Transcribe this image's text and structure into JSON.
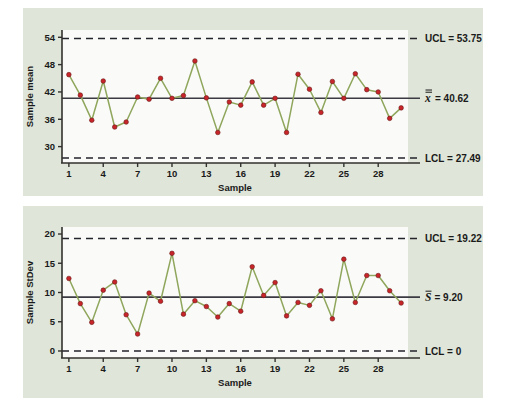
{
  "figure": {
    "background_color": "#ffffff",
    "panel_color": "#dfe5d8",
    "plot_background_color": "#fafbf9",
    "series_line_color": "#8fa65c",
    "series_point_color": "#c7252a",
    "center_line_color": "#3b3a42",
    "limit_line_color": "#23232b"
  },
  "chart_data": [
    {
      "type": "line",
      "id": "xbar-chart",
      "title": "",
      "xlabel": "Sample",
      "ylabel": "Sample mean",
      "x": [
        1,
        2,
        3,
        4,
        5,
        6,
        7,
        8,
        9,
        10,
        11,
        12,
        13,
        14,
        15,
        16,
        17,
        18,
        19,
        20,
        21,
        22,
        23,
        24,
        25,
        26,
        27,
        28,
        29,
        30
      ],
      "values": [
        45.8,
        41.3,
        35.8,
        44.4,
        34.3,
        35.4,
        40.9,
        40.4,
        45.0,
        40.6,
        41.2,
        48.8,
        40.7,
        33.1,
        39.8,
        39.1,
        44.2,
        39.1,
        40.6,
        33.1,
        45.9,
        42.6,
        37.5,
        44.3,
        40.6,
        46.0,
        42.5,
        42.0,
        36.2,
        38.5
      ],
      "xticks": [
        1,
        4,
        7,
        10,
        13,
        16,
        19,
        22,
        25,
        28
      ],
      "yticks": [
        30,
        36,
        42,
        48,
        54
      ],
      "xlim": [
        0.4,
        30.6
      ],
      "ylim": [
        26.4,
        55.6
      ],
      "grid": false,
      "legend_position": "right-outside",
      "reference_lines": [
        {
          "name": "UCL",
          "label": "UCL = 53.75",
          "value": 53.75,
          "style": "dashed"
        },
        {
          "name": "center",
          "label_symbol": "x",
          "label_text": "= 40.62",
          "value": 40.62,
          "style": "solid"
        },
        {
          "name": "LCL",
          "label": "LCL = 27.49",
          "value": 27.49,
          "style": "dashed"
        }
      ]
    },
    {
      "type": "line",
      "id": "s-chart",
      "title": "",
      "xlabel": "Sample",
      "ylabel": "Sample StDev",
      "x": [
        1,
        2,
        3,
        4,
        5,
        6,
        7,
        8,
        9,
        10,
        11,
        12,
        13,
        14,
        15,
        16,
        17,
        18,
        19,
        20,
        21,
        22,
        23,
        24,
        25,
        26,
        27,
        28,
        29,
        30
      ],
      "values": [
        12.4,
        8.1,
        4.9,
        10.4,
        11.8,
        6.2,
        2.9,
        9.9,
        8.5,
        16.7,
        6.3,
        8.6,
        7.6,
        5.8,
        8.1,
        6.8,
        14.4,
        9.5,
        11.7,
        6.0,
        8.3,
        7.8,
        10.3,
        5.5,
        15.7,
        8.3,
        12.9,
        12.9,
        10.3,
        8.2
      ],
      "xticks": [
        1,
        4,
        7,
        10,
        13,
        16,
        19,
        22,
        25,
        28
      ],
      "yticks": [
        0,
        5,
        10,
        15,
        20
      ],
      "xlim": [
        0.4,
        30.6
      ],
      "ylim": [
        -1.2,
        21.2
      ],
      "grid": false,
      "legend_position": "right-outside",
      "reference_lines": [
        {
          "name": "UCL",
          "label": "UCL = 19.22",
          "value": 19.22,
          "style": "dashed"
        },
        {
          "name": "center",
          "label_symbol": "S",
          "label_text": "= 9.20",
          "value": 9.2,
          "style": "solid"
        },
        {
          "name": "LCL",
          "label": "LCL = 0",
          "value": 0,
          "style": "dashed"
        }
      ]
    }
  ],
  "top_chart": {
    "ylabel": "Sample mean",
    "xlabel": "Sample",
    "ytick_labels": [
      "54",
      "48",
      "42",
      "36",
      "30"
    ],
    "xtick_labels": [
      "1",
      "4",
      "7",
      "10",
      "13",
      "16",
      "19",
      "22",
      "25",
      "28"
    ],
    "ucl_label": "UCL = 53.75",
    "center_symbol": "x",
    "center_label": "= 40.62",
    "lcl_label": "LCL = 27.49"
  },
  "bottom_chart": {
    "ylabel": "Sample StDev",
    "xlabel": "Sample",
    "ytick_labels": [
      "20",
      "15",
      "10",
      "5",
      "0"
    ],
    "xtick_labels": [
      "1",
      "4",
      "7",
      "10",
      "13",
      "16",
      "19",
      "22",
      "25",
      "28"
    ],
    "ucl_label": "UCL = 19.22",
    "center_symbol": "S",
    "center_label": "= 9.20",
    "lcl_label": "LCL = 0"
  }
}
